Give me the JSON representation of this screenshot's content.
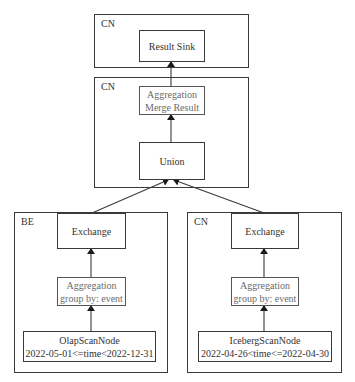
{
  "fragments": [
    {
      "label": "CN",
      "nodes": [
        {
          "lines": [
            "Result Sink"
          ]
        }
      ]
    },
    {
      "label": "CN",
      "nodes": [
        {
          "lines": [
            "Aggregation",
            "Merge Result"
          ]
        },
        {
          "lines": [
            "Union"
          ]
        }
      ]
    },
    {
      "label": "BE",
      "nodes": [
        {
          "lines": [
            "Exchange"
          ]
        },
        {
          "lines": [
            "Aggregation",
            "group by: event"
          ]
        },
        {
          "lines": [
            "OlapScanNode",
            "2022-05-01<=time<2022-12-31"
          ]
        }
      ]
    },
    {
      "label": "CN",
      "nodes": [
        {
          "lines": [
            "Exchange"
          ]
        },
        {
          "lines": [
            "Aggregation",
            "group by: event"
          ]
        },
        {
          "lines": [
            "IcebergScanNode",
            "2022-04-26<time<=2022-04-30"
          ]
        }
      ]
    }
  ],
  "colors": {
    "line": "#3a3a3a",
    "agg_text": "#6b6b6b"
  }
}
